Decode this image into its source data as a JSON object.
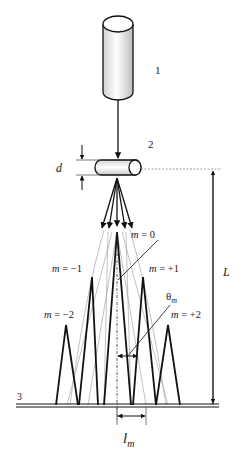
{
  "diagram": {
    "labels": {
      "source": "1",
      "crystal": "2",
      "screen": "3",
      "thickness": "d",
      "distance": "L",
      "spacing": "l",
      "spacing_sub": "m",
      "angle": "θ",
      "angle_sub": "m"
    },
    "orders": [
      {
        "m": "m = −2",
        "label": "m = −2"
      },
      {
        "m": "m = −1",
        "label": "m = −1"
      },
      {
        "m": "m = 0",
        "label": "m = 0"
      },
      {
        "m": "m = +1",
        "label": "m = +1"
      },
      {
        "m": "m = +2",
        "label": "m = +2"
      }
    ],
    "colors": {
      "line": "#111111",
      "thin": "#888888",
      "tube_fill": "#f0f0f0"
    }
  }
}
